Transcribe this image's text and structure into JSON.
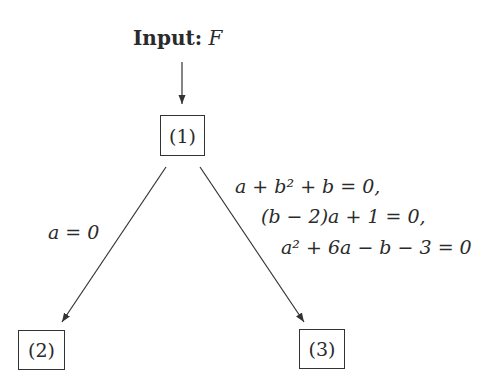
{
  "diagram": {
    "input": {
      "label": "Input:",
      "variable": "F"
    },
    "nodes": [
      {
        "id": "1",
        "label": "(1)"
      },
      {
        "id": "2",
        "label": "(2)"
      },
      {
        "id": "3",
        "label": "(3)"
      }
    ],
    "edges": [
      {
        "from": "input",
        "to": "1",
        "label": ""
      },
      {
        "from": "1",
        "to": "2",
        "label": "a = 0"
      },
      {
        "from": "1",
        "to": "3",
        "label_lines": [
          "a + b² + b = 0,",
          "(b − 2)a + 1 = 0,",
          "a² + 6a − b − 3 = 0"
        ]
      }
    ]
  }
}
